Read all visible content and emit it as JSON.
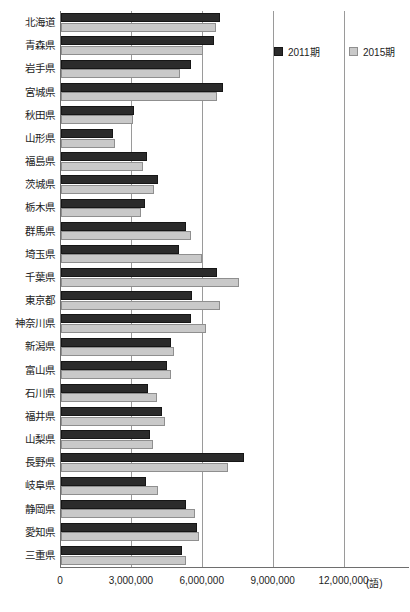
{
  "chart_data": {
    "type": "bar",
    "orientation": "horizontal",
    "title": "",
    "xlabel": "(語)",
    "ylabel": "",
    "xlim": [
      0,
      14772000
    ],
    "grid": true,
    "gridlines": [
      0,
      3000000,
      6000000,
      9000000,
      12000000
    ],
    "xticks": [
      "0",
      "3,000,000",
      "6,000,000",
      "9,000,000",
      "12,000,000"
    ],
    "unit_label": "(語)",
    "legend_position": "top-right",
    "categories": [
      "北海道",
      "青森県",
      "岩手県",
      "宮城県",
      "秋田県",
      "山形県",
      "福島県",
      "茨城県",
      "栃木県",
      "群馬県",
      "埼玉県",
      "千葉県",
      "東京都",
      "神奈川県",
      "新潟県",
      "富山県",
      "石川県",
      "福井県",
      "山梨県",
      "長野県",
      "岐阜県",
      "静岡県",
      "愛知県",
      "三重県"
    ],
    "series": [
      {
        "name": "2011期",
        "color": "#2b2b2b",
        "values": [
          6730000,
          6480000,
          5510000,
          6850000,
          3100000,
          2200000,
          3640000,
          4090000,
          3560000,
          5280000,
          4990000,
          6620000,
          5530000,
          5490000,
          4640000,
          4500000,
          3680000,
          4270000,
          3750000,
          7740000,
          3610000,
          5300000,
          5740000,
          5130000
        ]
      },
      {
        "name": "2015期",
        "color": "#c9c9c9",
        "values": [
          6560000,
          6030000,
          5050000,
          6600000,
          3030000,
          2270000,
          3450000,
          3940000,
          3380000,
          5510000,
          5960000,
          7530000,
          6740000,
          6130000,
          4770000,
          4660000,
          4060000,
          4400000,
          3880000,
          7060000,
          4120000,
          5660000,
          5860000,
          5280000
        ]
      }
    ]
  },
  "legend": {
    "items": [
      {
        "label": "2011期",
        "swatch": "dark-square-swatch"
      },
      {
        "label": "2015期",
        "swatch": "light-square-swatch"
      }
    ]
  },
  "top_fragment": ""
}
